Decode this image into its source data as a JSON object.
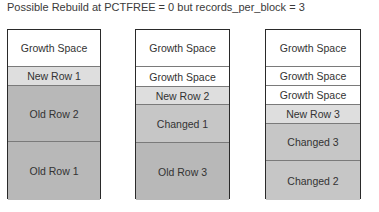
{
  "title": "Possible Rebuild at PCTFREE = 0 but records_per_block = 3",
  "blocks": [
    {
      "left": 7,
      "width": 94,
      "cells": [
        {
          "label": "Growth Space",
          "kind": "growth",
          "height": 37
        },
        {
          "label": "New Row 1",
          "kind": "new",
          "height": 19
        },
        {
          "label": "Old Row 2",
          "kind": "old",
          "height": 56
        },
        {
          "label": "Old Row 1",
          "kind": "old",
          "height": 58
        }
      ]
    },
    {
      "left": 135,
      "width": 95,
      "cells": [
        {
          "label": "Growth Space",
          "kind": "growth",
          "height": 37
        },
        {
          "label": "Growth Space",
          "kind": "growth",
          "height": 20
        },
        {
          "label": "New Row 2",
          "kind": "new",
          "height": 18
        },
        {
          "label": "Changed 1",
          "kind": "changed",
          "height": 38
        },
        {
          "label": "Old Row 3",
          "kind": "old",
          "height": 57
        }
      ]
    },
    {
      "left": 265,
      "width": 96,
      "cells": [
        {
          "label": "Growth Space",
          "kind": "growth",
          "height": 37
        },
        {
          "label": "Growth Space",
          "kind": "growth",
          "height": 19
        },
        {
          "label": "Growth Space",
          "kind": "growth",
          "height": 19
        },
        {
          "label": "New Row 3",
          "kind": "new",
          "height": 19
        },
        {
          "label": "Changed 3",
          "kind": "changed",
          "height": 37
        },
        {
          "label": "Changed 2",
          "kind": "changed",
          "height": 39
        }
      ]
    }
  ],
  "colors": {
    "growth": "#ffffff",
    "new": "#dedede",
    "changed": "#c6c6c6",
    "old": "#b8b8b8",
    "border": "#2a2a2a"
  }
}
